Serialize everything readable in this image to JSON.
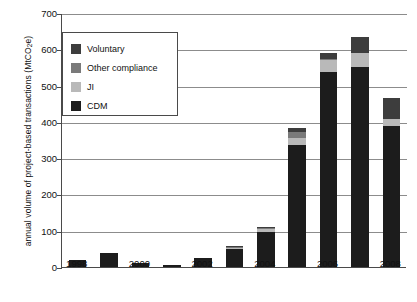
{
  "chart_data": {
    "type": "bar",
    "stacked": true,
    "title": "",
    "xlabel": "",
    "ylabel": "annual volume of project-based transactions (MtCO2e)",
    "ylabel_html": "annual volume of project-based transactions (MtCO<sub>2</sub>e)",
    "ylim": [
      0,
      700
    ],
    "ytick_step": 100,
    "yticks": [
      0,
      100,
      200,
      300,
      400,
      500,
      600,
      700
    ],
    "ytick_labels": [
      "0",
      "100",
      "200",
      "300",
      "400",
      "500",
      "600",
      "700"
    ],
    "grid": "horizontal",
    "legend_position": "upper-left-inside",
    "categories": [
      1998,
      1999,
      2000,
      2001,
      2002,
      2003,
      2004,
      2005,
      2006,
      2007,
      2008
    ],
    "xtick_labels": [
      "1998",
      "",
      "2000",
      "",
      "2002",
      "",
      "2004",
      "",
      "2006",
      "",
      "2008"
    ],
    "series": [
      {
        "name": "CDM",
        "color": "#1c1c1c",
        "values": [
          18,
          38,
          11,
          6,
          26,
          50,
          97,
          335,
          537,
          551,
          389
        ]
      },
      {
        "name": "JI",
        "color": "#b9b9b9",
        "values": [
          0,
          0,
          0,
          0,
          0,
          2,
          8,
          20,
          33,
          39,
          18
        ]
      },
      {
        "name": "Other compliance",
        "color": "#7a7a7a",
        "values": [
          0,
          0,
          0,
          0,
          0,
          2,
          3,
          16,
          3,
          0,
          0
        ]
      },
      {
        "name": "Voluntary",
        "color": "#3d3d3d",
        "values": [
          0,
          0,
          0,
          0,
          0,
          2,
          3,
          13,
          17,
          45,
          58
        ]
      }
    ],
    "stack_order_bottom_to_top": [
      "CDM",
      "JI",
      "Other compliance",
      "Voluntary"
    ],
    "totals": [
      18,
      38,
      11,
      6,
      26,
      56,
      111,
      384,
      590,
      635,
      465
    ]
  },
  "legend": {
    "items": [
      {
        "label": "Voluntary",
        "color": "#3d3d3d"
      },
      {
        "label": "Other compliance",
        "color": "#7a7a7a"
      },
      {
        "label": "JI",
        "color": "#b9b9b9"
      },
      {
        "label": "CDM",
        "color": "#1c1c1c"
      }
    ]
  },
  "axis_style": {
    "axis_color": "#4a4a4a",
    "grid_color": "#8c8c8c",
    "background": "#ffffff"
  }
}
